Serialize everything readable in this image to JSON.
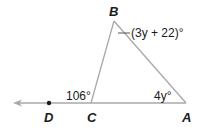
{
  "diagram": {
    "points": {
      "A": {
        "label": "A"
      },
      "B": {
        "label": "B"
      },
      "C": {
        "label": "C"
      },
      "D": {
        "label": "D"
      }
    },
    "angles": {
      "exterior_at_C": "106°",
      "at_A": "4y°",
      "at_B": "(3y + 22)°"
    },
    "colors": {
      "line": "#a8a8a8",
      "text": "#1a1a1a"
    }
  }
}
